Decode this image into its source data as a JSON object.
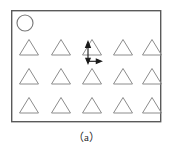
{
  "figure": {
    "caption": "（a）",
    "label": "a",
    "background_color": "#ffffff",
    "frame": {
      "name": "specimen-plate-outline",
      "x": 11,
      "y": 10,
      "width": 150,
      "height": 112,
      "stroke_color": "#5a5a5a",
      "stroke_width": 1.4,
      "fill_color": "#ffffff"
    },
    "circle_marker": {
      "name": "circular-defect-marker",
      "cx": 25,
      "cy": 23,
      "r": 8,
      "stroke_color": "#7a7a7a",
      "stroke_width": 1.1,
      "fill_color": "none"
    },
    "triangle_grid": {
      "name": "triangular-defect-array",
      "rows": 3,
      "columns": 5,
      "count": 15,
      "row_y_centers": [
        47,
        76,
        105
      ],
      "column_x_centers": [
        29,
        61,
        92,
        123,
        152
      ],
      "triangle_width": 19,
      "triangle_height": 16,
      "stroke_color": "#8c8c8c",
      "stroke_width": 1.0,
      "fill_color": "none"
    },
    "dimension_arrows": {
      "name": "spacing-dimension-arrows",
      "stroke_color": "#1a1a1a",
      "stroke_width": 1.1,
      "vertical": {
        "label": "vertical-spacing-arrow",
        "x": 88,
        "y_top": 42,
        "y_bottom": 62,
        "head_at": "both"
      },
      "horizontal": {
        "label": "horizontal-spacing-arrow",
        "y": 62,
        "x_left": 88,
        "x_right": 101,
        "head_at": "right"
      }
    }
  }
}
